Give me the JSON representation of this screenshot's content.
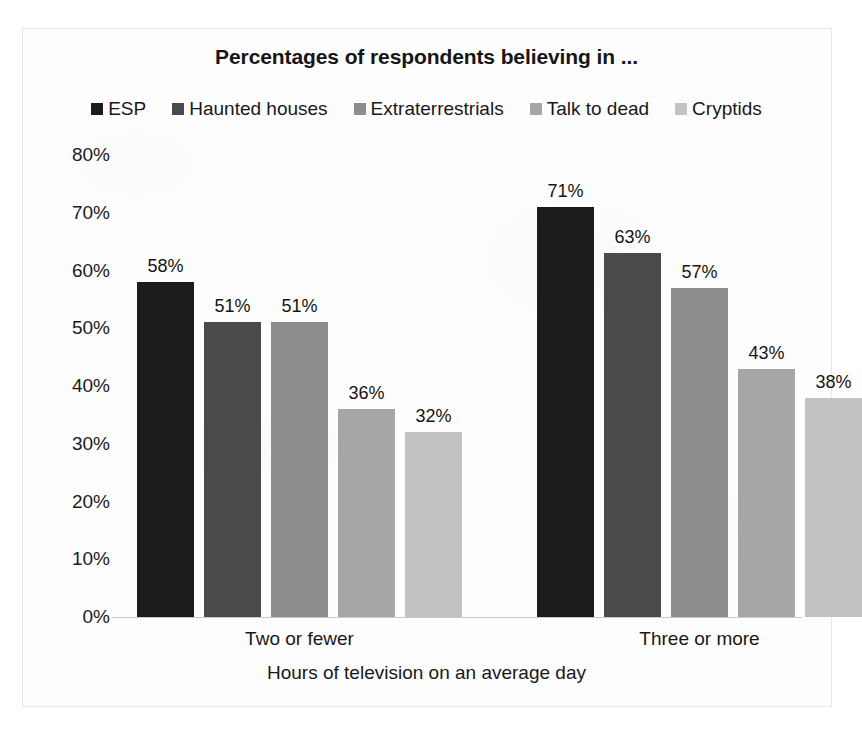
{
  "chart_data": {
    "type": "bar",
    "title": "Percentages of respondents believing in ...",
    "xlabel": "Hours of television on an average day",
    "ylabel": "",
    "categories": [
      "Two or fewer",
      "Three or more"
    ],
    "ylim": [
      0,
      80
    ],
    "yticks": [
      "0%",
      "10%",
      "20%",
      "30%",
      "40%",
      "50%",
      "60%",
      "70%",
      "80%"
    ],
    "ytick_values": [
      0,
      10,
      20,
      30,
      40,
      50,
      60,
      70,
      80
    ],
    "grid": false,
    "legend_position": "top",
    "value_suffix": "%",
    "series": [
      {
        "name": "ESP",
        "color": "#1c1c1c",
        "values": [
          58,
          71
        ],
        "labels": [
          "58%",
          "71%"
        ]
      },
      {
        "name": "Haunted houses",
        "color": "#4a4a4a",
        "values": [
          51,
          63
        ],
        "labels": [
          "51%",
          "63%"
        ]
      },
      {
        "name": "Extraterrestrials",
        "color": "#8d8d8d",
        "values": [
          51,
          57
        ],
        "labels": [
          "51%",
          "57%"
        ]
      },
      {
        "name": "Talk to dead",
        "color": "#a6a6a6",
        "values": [
          36,
          43
        ],
        "labels": [
          "36%",
          "43%"
        ]
      },
      {
        "name": "Cryptids",
        "color": "#c2c2c2",
        "values": [
          32,
          38
        ],
        "labels": [
          "32%",
          "38%"
        ]
      }
    ]
  }
}
